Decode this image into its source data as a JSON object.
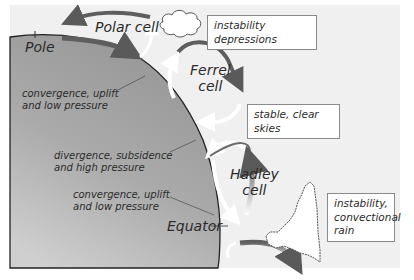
{
  "diagram": {
    "cells": [
      {
        "id": "polar",
        "label": "Polar cell"
      },
      {
        "id": "ferrel",
        "label_line1": "Ferrel",
        "label_line2": "cell"
      },
      {
        "id": "hadley",
        "label_line1": "Hadley",
        "label_line2": "cell"
      }
    ],
    "earth_labels": {
      "pole": "Pole",
      "equator": "Equator",
      "zone1_line1": "convergence, uplift",
      "zone1_line2": "and low pressure",
      "zone2_line1": "divergence, subsidence",
      "zone2_line2": "and high pressure",
      "zone3_line1": "convergence, uplift",
      "zone3_line2": "and low pressure"
    },
    "callouts": {
      "instability_depressions": "instability depressions",
      "stable_clear": "stable, clear skies",
      "convectional_line1": "instability,",
      "convectional_line2": "convectional",
      "convectional_line3": "rain"
    },
    "colors": {
      "background": "#f1f1f1",
      "earth_dark": "#9a9a9a",
      "earth_light": "#c4c4c4",
      "arrow_dark": "#5e5e5e",
      "arrow_white": "#ffffff",
      "outline": "#222222"
    }
  }
}
